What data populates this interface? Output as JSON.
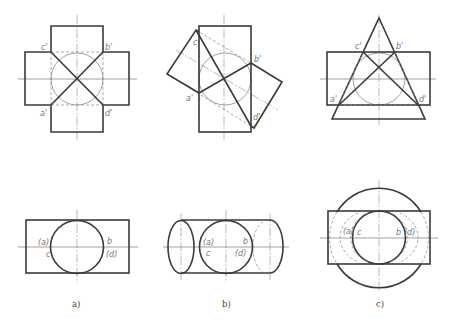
{
  "figure": {
    "panels": [
      {
        "id": "a",
        "caption": "a)",
        "front_view_labels": [
          "c'",
          "b'",
          "a'",
          "d'"
        ],
        "side_view_labels": [
          "(a)",
          "c",
          "b",
          "(d)"
        ]
      },
      {
        "id": "b",
        "caption": "b)",
        "front_view_labels": [
          "c'",
          "b'",
          "a'",
          "d'"
        ],
        "side_view_labels": [
          "(a)",
          "c",
          "b",
          "(d)"
        ]
      },
      {
        "id": "c",
        "caption": "c)",
        "front_view_labels": [
          "c'",
          "b'",
          "a'",
          "d'"
        ],
        "side_view_labels": [
          "(a)",
          "c",
          "b",
          "(d)"
        ]
      }
    ]
  },
  "colors": {
    "outline": "#3a3a3a",
    "thin": "#7a7a7a",
    "label": "#777777",
    "background": "#ffffff"
  }
}
